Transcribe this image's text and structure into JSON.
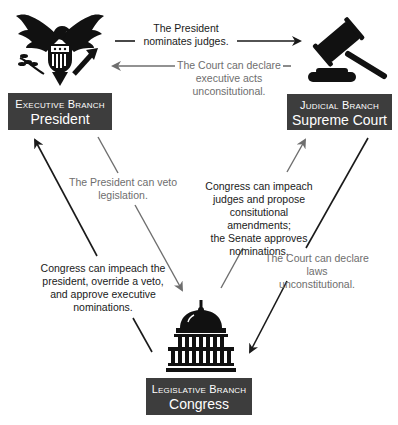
{
  "diagram": {
    "colors": {
      "box_bg": "#3d3d3d",
      "box_text": "#ffffff",
      "dark_arrow": "#1a1a1a",
      "gray_arrow": "#6e6e6e"
    },
    "nodes": {
      "executive": {
        "branch": "Executive Branch",
        "who": "President",
        "icon": "eagle-seal-icon"
      },
      "judicial": {
        "branch": "Judicial Branch",
        "who": "Supreme Court",
        "icon": "gavel-icon"
      },
      "legislative": {
        "branch": "Legislative Branch",
        "who": "Congress",
        "icon": "capitol-icon"
      }
    },
    "edges": {
      "exec_to_jud": {
        "line1": "The President",
        "line2": "nominates judges."
      },
      "jud_to_exec": {
        "line1": "The Court can declare",
        "line2": "executive acts",
        "line3": "unconsitutional."
      },
      "exec_to_leg": {
        "line1": "The President can veto",
        "line2": "legislation."
      },
      "leg_to_exec": {
        "line1": "Congress can impeach the",
        "line2": "president, override a veto,",
        "line3": "and approve executive",
        "line4": "nominations."
      },
      "leg_to_jud": {
        "line1": "Congress can impeach",
        "line2": "judges and propose",
        "line3": "consitutional amendments;",
        "line4": "the Senate approves",
        "line5": "nominations."
      },
      "jud_to_leg": {
        "line1": "The Court can declare laws",
        "line2": "unconstitutional."
      }
    }
  }
}
